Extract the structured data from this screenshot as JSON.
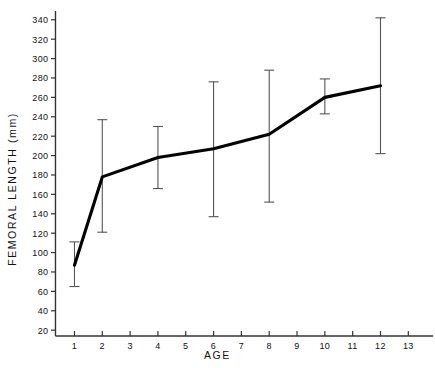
{
  "chart_data": {
    "type": "line",
    "title": "",
    "xlabel": "AGE",
    "ylabel": "FEMORAL  LENGTH  (mm)",
    "xlim": [
      0.3,
      13.6
    ],
    "ylim": [
      14,
      348
    ],
    "grid": false,
    "legend": "none",
    "x_ticks": [
      1,
      2,
      3,
      4,
      5,
      6,
      7,
      8,
      9,
      10,
      11,
      12,
      13
    ],
    "x_tick_labels": [
      "1",
      "2",
      "3",
      "4",
      "5",
      "6",
      "7",
      "8",
      "9",
      "10",
      "11",
      "12",
      "13"
    ],
    "y_ticks": [
      20,
      40,
      60,
      80,
      100,
      120,
      140,
      160,
      180,
      200,
      220,
      240,
      260,
      280,
      300,
      320,
      340
    ],
    "y_tick_labels": [
      "20",
      "40",
      "60",
      "80",
      "100",
      "120",
      "140",
      "160",
      "180",
      "200",
      "220",
      "240",
      "260",
      "280",
      "300",
      "320",
      "340"
    ],
    "x": [
      1,
      2,
      4,
      6,
      8,
      10,
      12
    ],
    "values": [
      87,
      178,
      198,
      207,
      222,
      260,
      272
    ],
    "error_low": [
      65,
      121,
      166,
      137,
      152,
      243,
      202
    ],
    "error_high": [
      111,
      237,
      230,
      276,
      288,
      279,
      342
    ],
    "series": [
      {
        "name": "Femoral length",
        "x": [
          1,
          2,
          4,
          6,
          8,
          10,
          12
        ],
        "values": [
          87,
          178,
          198,
          207,
          222,
          260,
          272
        ],
        "error_low": [
          65,
          121,
          166,
          137,
          152,
          243,
          202
        ],
        "error_high": [
          111,
          237,
          230,
          276,
          288,
          279,
          342
        ],
        "color": "#000000"
      }
    ],
    "line_color": "#000000",
    "errorbar_color": "#555555",
    "axis_color": "#333333"
  }
}
